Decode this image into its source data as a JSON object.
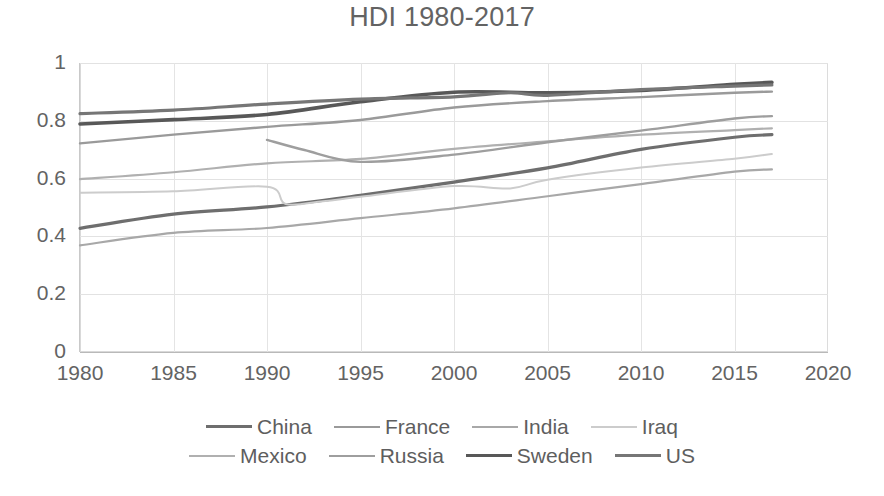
{
  "chart_data": {
    "type": "line",
    "title": "HDI 1980-2017",
    "xlabel": "",
    "ylabel": "",
    "xlim": [
      1980,
      2020
    ],
    "ylim": [
      0,
      1
    ],
    "xticks": [
      "1980",
      "1985",
      "1990",
      "1995",
      "2000",
      "2005",
      "2010",
      "2015",
      "2020"
    ],
    "yticks": [
      "0",
      "0.2",
      "0.4",
      "0.6",
      "0.8",
      "1"
    ],
    "grid": true,
    "legend_position": "bottom",
    "x": [
      1980,
      1985,
      1990,
      1995,
      2000,
      2005,
      2010,
      2015,
      2017
    ],
    "series": [
      {
        "name": "China",
        "color": "#6e6e6e",
        "width": 3.2,
        "x": [
          1980,
          1985,
          1990,
          1995,
          2000,
          2005,
          2010,
          2015,
          2017
        ],
        "values": [
          0.428,
          0.477,
          0.502,
          0.542,
          0.588,
          0.637,
          0.701,
          0.743,
          0.752
        ]
      },
      {
        "name": "France",
        "color": "#9a9a9a",
        "width": 2.4,
        "x": [
          1980,
          1985,
          1990,
          1995,
          2000,
          2005,
          2010,
          2015,
          2017
        ],
        "values": [
          0.722,
          0.752,
          0.779,
          0.803,
          0.846,
          0.868,
          0.882,
          0.897,
          0.901
        ]
      },
      {
        "name": "India",
        "color": "#a8a8a8",
        "width": 2.2,
        "x": [
          1980,
          1985,
          1990,
          1995,
          2000,
          2005,
          2010,
          2015,
          2017
        ],
        "values": [
          0.369,
          0.412,
          0.429,
          0.463,
          0.497,
          0.539,
          0.581,
          0.624,
          0.632
        ]
      },
      {
        "name": "Iraq",
        "color": "#cccccc",
        "width": 2.0,
        "x": [
          1980,
          1985,
          1990,
          1991,
          1993,
          1995,
          2000,
          2003,
          2005,
          2010,
          2015,
          2017
        ],
        "values": [
          0.551,
          0.556,
          0.572,
          0.512,
          0.522,
          0.537,
          0.574,
          0.566,
          0.596,
          0.638,
          0.669,
          0.685
        ]
      },
      {
        "name": "Mexico",
        "color": "#b0b0b0",
        "width": 2.2,
        "x": [
          1980,
          1985,
          1990,
          1995,
          2000,
          2005,
          2010,
          2015,
          2017
        ],
        "values": [
          0.598,
          0.622,
          0.653,
          0.668,
          0.703,
          0.729,
          0.752,
          0.768,
          0.774
        ]
      },
      {
        "name": "Russia",
        "color": "#9e9e9e",
        "width": 2.4,
        "x": [
          1990,
          1992,
          1995,
          2000,
          2005,
          2010,
          2015,
          2017
        ],
        "values": [
          0.734,
          0.699,
          0.658,
          0.683,
          0.726,
          0.766,
          0.808,
          0.816
        ]
      },
      {
        "name": "Sweden",
        "color": "#585858",
        "width": 3.6,
        "x": [
          1980,
          1985,
          1990,
          1995,
          2000,
          2005,
          2010,
          2015,
          2017
        ],
        "values": [
          0.789,
          0.804,
          0.822,
          0.866,
          0.899,
          0.897,
          0.905,
          0.926,
          0.933
        ]
      },
      {
        "name": "US",
        "color": "#767676",
        "width": 3.2,
        "x": [
          1980,
          1985,
          1990,
          1995,
          2000,
          2003,
          2005,
          2010,
          2015,
          2017
        ],
        "values": [
          0.825,
          0.837,
          0.858,
          0.875,
          0.883,
          0.897,
          0.888,
          0.908,
          0.92,
          0.924
        ]
      }
    ]
  },
  "legend": {
    "rows": [
      [
        "China",
        "France",
        "India",
        "Iraq"
      ],
      [
        "Mexico",
        "Russia",
        "Sweden",
        "US"
      ]
    ]
  }
}
